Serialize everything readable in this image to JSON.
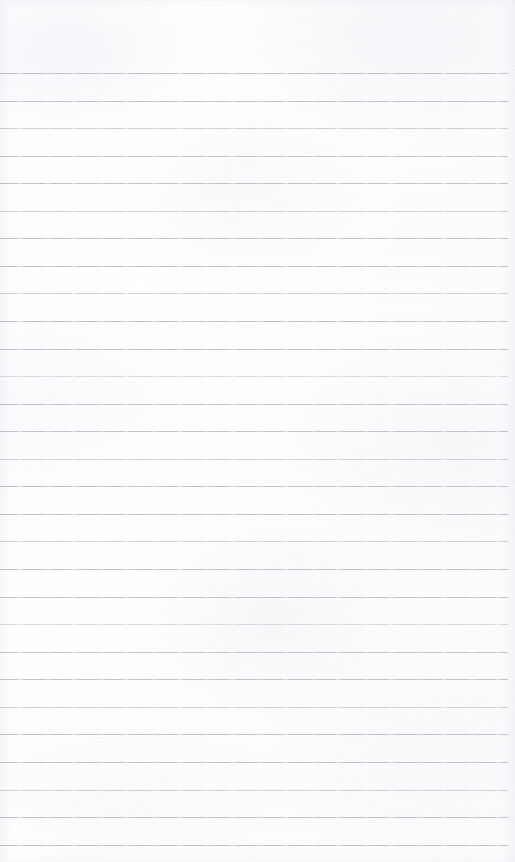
{
  "document": {
    "kind": "scanned-ruled-notebook-page",
    "title": "Blank ruled notebook page",
    "content_text": "",
    "has_handwriting": false,
    "has_printed_text": false,
    "page_width_px": 515,
    "page_height_px": 862
  },
  "colors": {
    "paper": "#fdfdfd",
    "paper_highlight": "#ffffff",
    "rule_line": "#babec6",
    "edge_shade": "#f1f2f5"
  },
  "ruling": {
    "style": "college-ruled horizontal lines",
    "line_count": 29,
    "line_spacing_px": 28,
    "first_line_y_px": 73,
    "last_line_y_px": 845,
    "line_thickness_px": 1,
    "line_left_x_px": 0,
    "line_right_x_px": 508,
    "top_margin_px": 73,
    "bottom_margin_px": 17,
    "margin_rule": "none",
    "lines": [
      {
        "index": 1,
        "y": 73,
        "opacity": "normal"
      },
      {
        "index": 2,
        "y": 101,
        "opacity": "normal"
      },
      {
        "index": 3,
        "y": 128,
        "opacity": "soft"
      },
      {
        "index": 4,
        "y": 156,
        "opacity": "normal"
      },
      {
        "index": 5,
        "y": 183,
        "opacity": "normal"
      },
      {
        "index": 6,
        "y": 211,
        "opacity": "soft"
      },
      {
        "index": 7,
        "y": 238,
        "opacity": "normal"
      },
      {
        "index": 8,
        "y": 266,
        "opacity": "normal"
      },
      {
        "index": 9,
        "y": 293,
        "opacity": "soft"
      },
      {
        "index": 10,
        "y": 321,
        "opacity": "normal"
      },
      {
        "index": 11,
        "y": 349,
        "opacity": "normal"
      },
      {
        "index": 12,
        "y": 376,
        "opacity": "softer"
      },
      {
        "index": 13,
        "y": 404,
        "opacity": "normal"
      },
      {
        "index": 14,
        "y": 431,
        "opacity": "normal"
      },
      {
        "index": 15,
        "y": 459,
        "opacity": "soft"
      },
      {
        "index": 16,
        "y": 486,
        "opacity": "normal"
      },
      {
        "index": 17,
        "y": 514,
        "opacity": "normal"
      },
      {
        "index": 18,
        "y": 541,
        "opacity": "soft"
      },
      {
        "index": 19,
        "y": 569,
        "opacity": "normal"
      },
      {
        "index": 20,
        "y": 597,
        "opacity": "normal"
      },
      {
        "index": 21,
        "y": 624,
        "opacity": "softer"
      },
      {
        "index": 22,
        "y": 652,
        "opacity": "normal"
      },
      {
        "index": 23,
        "y": 679,
        "opacity": "normal"
      },
      {
        "index": 24,
        "y": 707,
        "opacity": "soft"
      },
      {
        "index": 25,
        "y": 734,
        "opacity": "normal"
      },
      {
        "index": 26,
        "y": 762,
        "opacity": "normal"
      },
      {
        "index": 27,
        "y": 790,
        "opacity": "soft"
      },
      {
        "index": 28,
        "y": 817,
        "opacity": "normal"
      },
      {
        "index": 29,
        "y": 845,
        "opacity": "normal"
      }
    ]
  }
}
